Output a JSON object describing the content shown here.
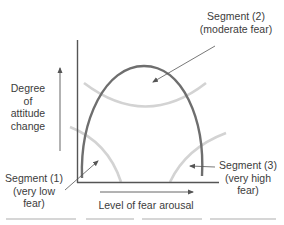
{
  "diagram": {
    "y_axis": {
      "label": [
        "Degree",
        "of",
        "attitude",
        "change"
      ]
    },
    "x_axis": {
      "label": "Level of fear arousal"
    },
    "segments": [
      {
        "id": 1,
        "label": [
          "Segment (1)",
          "(very low",
          "fear)"
        ]
      },
      {
        "id": 2,
        "label": [
          "Segment (2)",
          "(moderate fear)"
        ]
      },
      {
        "id": 3,
        "label": [
          "Segment (3)",
          "(very high",
          "fear)"
        ]
      }
    ],
    "colors": {
      "main_curve": "#6e6e6e",
      "segment_arcs": "#d3d3d3",
      "axes": "#555555",
      "arrows": "#555555",
      "text": "#3c3c3c"
    }
  }
}
